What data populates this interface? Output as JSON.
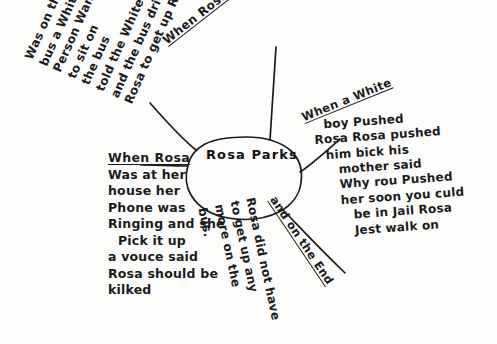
{
  "document": {
    "type": "hand-drawn-mind-map",
    "subject": "Rosa Parks",
    "ink_color": "#1b1b1b",
    "paper_color": "#fdfdfc"
  },
  "center": {
    "label": "Rosa Parks"
  },
  "branches": {
    "bus": {
      "heading": "When Rosa",
      "lines": [
        "Was on the",
        "bus a White",
        "Person Want",
        "to sit on",
        "the bus",
        "told the White man",
        "and the bus driver",
        "Rosa to get up Rosa siad no"
      ]
    },
    "phone": {
      "heading": "When Rosa",
      "lines": [
        "Was at her",
        "house her",
        "Phone was",
        "Ringing and she",
        "Pick it up",
        "a vouce said",
        "Rosa should be",
        "kilked"
      ]
    },
    "white_boy": {
      "heading": "When a White",
      "lines": [
        "boy Pushed",
        "Rosa  Rosa pushed",
        "him bick his",
        "mother said",
        "Why rou Pushed",
        "her soon you culd",
        "be in Jail Rosa",
        "Jest walk on"
      ]
    },
    "end": {
      "heading": "and on the End",
      "lines": [
        "Rosa did not have",
        "to get up any",
        "more on the",
        "bus."
      ]
    }
  }
}
